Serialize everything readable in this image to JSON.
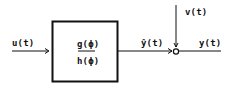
{
  "diagram": {
    "input_signal": "u(t)",
    "block": {
      "numerator": "g(ϕ)",
      "denominator": "h(ϕ)"
    },
    "intermediate_signal": "ŷ(t)",
    "noise_signal": "v(t)",
    "output_signal": "y(t)",
    "summing_junction": "O",
    "colors": {
      "stroke": "#111111",
      "background": "#ffffff"
    }
  }
}
